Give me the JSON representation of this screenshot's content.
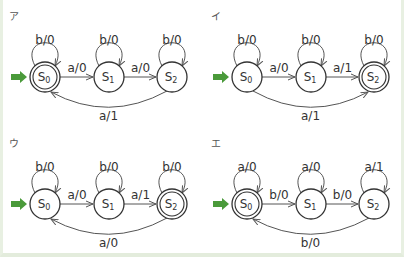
{
  "colors": {
    "line": "#555555",
    "start_arrow": "#4a9a3a",
    "border": "#e6eee0"
  },
  "panels": [
    {
      "id": "a",
      "label": "ア",
      "ox": 0,
      "oy": 0,
      "accepting": [
        0
      ],
      "loops": [
        "b/0",
        "b/0",
        "b/0"
      ],
      "edge01": "a/0",
      "edge12": "a/0",
      "arc": {
        "label": "a/1",
        "direction": "2to0"
      }
    },
    {
      "id": "i",
      "label": "イ",
      "ox": 202,
      "oy": 0,
      "accepting": [
        2
      ],
      "loops": [
        "b/0",
        "b/0",
        "b/0"
      ],
      "edge01": "a/0",
      "edge12": "a/1",
      "arc": {
        "label": "a/1",
        "direction": "0to2"
      }
    },
    {
      "id": "u",
      "label": "ウ",
      "ox": 0,
      "oy": 127,
      "accepting": [
        2
      ],
      "loops": [
        "b/0",
        "b/0",
        "b/0"
      ],
      "edge01": "a/0",
      "edge12": "a/1",
      "arc": {
        "label": "a/0",
        "direction": "2to0"
      }
    },
    {
      "id": "e",
      "label": "エ",
      "ox": 202,
      "oy": 127,
      "accepting": [
        0
      ],
      "loops": [
        "a/0",
        "a/0",
        "a/1"
      ],
      "edge01": "b/0",
      "edge12": "b/0",
      "arc": {
        "label": "b/0",
        "direction": "2to0"
      }
    }
  ],
  "states": [
    "S",
    "S",
    "S"
  ],
  "state_subscripts": [
    "0",
    "1",
    "2"
  ]
}
